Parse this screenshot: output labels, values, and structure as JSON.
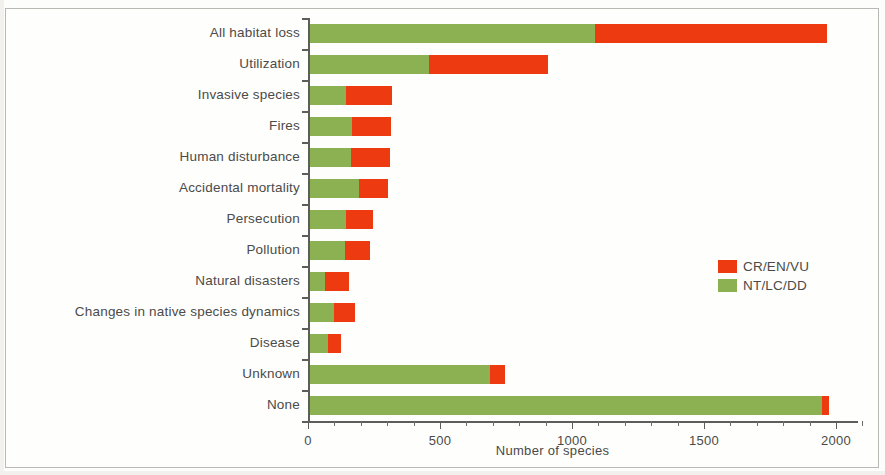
{
  "chart_data": {
    "type": "bar",
    "orientation": "horizontal",
    "stacked": true,
    "title": "",
    "xlabel": "Number of species",
    "ylabel": "",
    "xlim": [
      0,
      2100
    ],
    "xticks": [
      0,
      500,
      1000,
      1500,
      2000
    ],
    "xtick_labels": [
      "0",
      "500",
      "1000",
      "1500",
      "2000"
    ],
    "minor_tick_step": 100,
    "grid": false,
    "legend_position": "right-middle",
    "colors": {
      "CR/EN/VU": "#ee3a10",
      "NT/LC/DD": "#8cb152"
    },
    "categories": [
      "All habitat loss",
      "Utilization",
      "Invasive species",
      "Fires",
      "Human disturbance",
      "Accidental mortality",
      "Persecution",
      "Pollution",
      "Natural disasters",
      "Changes in native species dynamics",
      "Disease",
      "Unknown",
      "None"
    ],
    "series": [
      {
        "name": "NT/LC/DD",
        "color": "#8cb152",
        "values": [
          1080,
          450,
          135,
          158,
          155,
          185,
          135,
          132,
          57,
          90,
          68,
          680,
          1940
        ]
      },
      {
        "name": "CR/EN/VU",
        "color": "#ee3a10",
        "values": [
          880,
          450,
          175,
          148,
          148,
          110,
          105,
          95,
          90,
          80,
          48,
          58,
          25
        ]
      }
    ],
    "totals": [
      1960,
      900,
      310,
      306,
      303,
      295,
      240,
      227,
      147,
      170,
      116,
      738,
      1965
    ]
  },
  "legend": {
    "entries": [
      {
        "label": "CR/EN/VU",
        "color": "#ee3a10",
        "swatch": "red-swatch"
      },
      {
        "label": "NT/LC/DD",
        "color": "#8cb152",
        "swatch": "green-swatch"
      }
    ]
  },
  "axis": {
    "x_title": "Number of species"
  }
}
